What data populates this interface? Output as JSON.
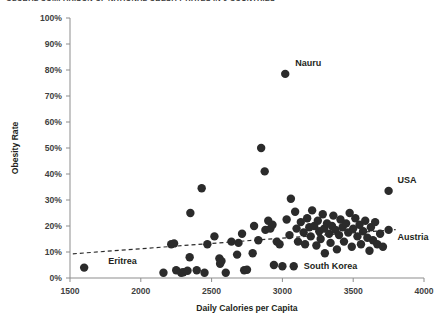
{
  "chart_title": "GLOBAL COMPARISON OF NATIONAL OBESITY RATES IN 9 COUNTRIES",
  "axis": {
    "x_title": "Daily Calories per Capita",
    "y_title": "Obesity Rate",
    "x_ticks": [
      "1500",
      "2000",
      "2500",
      "3000",
      "3500",
      "4000"
    ],
    "y_ticks": [
      "100%",
      "90%",
      "80%",
      "70%",
      "60%",
      "50%",
      "40%",
      "30%",
      "20%",
      "10%",
      "0%"
    ]
  },
  "annotations": [
    {
      "name": "Nauru",
      "x": 3020,
      "y": 78.5,
      "dx": 10,
      "dy": -8
    },
    {
      "name": "USA",
      "x": 3750,
      "y": 33.5,
      "dx": 9,
      "dy": -8
    },
    {
      "name": "Austria",
      "x": 3750,
      "y": 18.5,
      "dx": 9,
      "dy": 10
    },
    {
      "name": "Eritrea",
      "x": 1600,
      "y": 4.0,
      "dx": 24,
      "dy": -4
    },
    {
      "name": "South Korea",
      "x": 3080,
      "y": 4.5,
      "dx": 10,
      "dy": 3
    }
  ],
  "chart_data": {
    "type": "scatter",
    "title": "GLOBAL COMPARISON OF NATIONAL OBESITY RATES IN 9 COUNTRIES",
    "xlabel": "Daily Calories per Capita",
    "ylabel": "Obesity Rate",
    "xlim": [
      1500,
      4000
    ],
    "ylim": [
      0,
      100
    ],
    "xticks": [
      1500,
      2000,
      2500,
      3000,
      3500,
      4000
    ],
    "yticks": [
      0,
      10,
      20,
      30,
      40,
      50,
      60,
      70,
      80,
      90,
      100
    ],
    "grid": false,
    "legend": "none",
    "marker_color": "#2b2b2b",
    "trendline": {
      "style": "dashed",
      "color": "#2b2b2b",
      "x_start": 1520,
      "y_start": 9.3,
      "x_end": 3800,
      "y_end": 18.6
    },
    "points": [
      {
        "x": 1600,
        "y": 4.0,
        "label": "Eritrea"
      },
      {
        "x": 2160,
        "y": 2.0,
        "label": ""
      },
      {
        "x": 2215,
        "y": 13.0,
        "label": ""
      },
      {
        "x": 2235,
        "y": 13.3,
        "label": ""
      },
      {
        "x": 2250,
        "y": 3.0,
        "label": ""
      },
      {
        "x": 2285,
        "y": 2.0,
        "label": ""
      },
      {
        "x": 2300,
        "y": 2.2,
        "label": ""
      },
      {
        "x": 2330,
        "y": 2.8,
        "label": ""
      },
      {
        "x": 2345,
        "y": 8.0,
        "label": ""
      },
      {
        "x": 2350,
        "y": 25.0,
        "label": ""
      },
      {
        "x": 2395,
        "y": 3.0,
        "label": ""
      },
      {
        "x": 2430,
        "y": 34.5,
        "label": ""
      },
      {
        "x": 2450,
        "y": 2.0,
        "label": ""
      },
      {
        "x": 2470,
        "y": 13.0,
        "label": ""
      },
      {
        "x": 2520,
        "y": 16.0,
        "label": ""
      },
      {
        "x": 2555,
        "y": 7.5,
        "label": ""
      },
      {
        "x": 2560,
        "y": 5.5,
        "label": ""
      },
      {
        "x": 2570,
        "y": 6.5,
        "label": ""
      },
      {
        "x": 2600,
        "y": 2.0,
        "label": ""
      },
      {
        "x": 2640,
        "y": 14.0,
        "label": ""
      },
      {
        "x": 2680,
        "y": 9.0,
        "label": ""
      },
      {
        "x": 2690,
        "y": 13.5,
        "label": ""
      },
      {
        "x": 2715,
        "y": 17.0,
        "label": ""
      },
      {
        "x": 2730,
        "y": 3.0,
        "label": ""
      },
      {
        "x": 2750,
        "y": 3.2,
        "label": ""
      },
      {
        "x": 2790,
        "y": 9.5,
        "label": ""
      },
      {
        "x": 2800,
        "y": 20.0,
        "label": ""
      },
      {
        "x": 2830,
        "y": 14.5,
        "label": ""
      },
      {
        "x": 2850,
        "y": 50.0,
        "label": ""
      },
      {
        "x": 2875,
        "y": 41.0,
        "label": ""
      },
      {
        "x": 2880,
        "y": 18.5,
        "label": ""
      },
      {
        "x": 2900,
        "y": 22.0,
        "label": ""
      },
      {
        "x": 2915,
        "y": 19.0,
        "label": ""
      },
      {
        "x": 2930,
        "y": 20.5,
        "label": ""
      },
      {
        "x": 2940,
        "y": 5.0,
        "label": ""
      },
      {
        "x": 2960,
        "y": 14.0,
        "label": ""
      },
      {
        "x": 2980,
        "y": 13.0,
        "label": ""
      },
      {
        "x": 3000,
        "y": 4.5,
        "label": ""
      },
      {
        "x": 3020,
        "y": 78.5,
        "label": "Nauru"
      },
      {
        "x": 3030,
        "y": 22.5,
        "label": ""
      },
      {
        "x": 3050,
        "y": 16.5,
        "label": ""
      },
      {
        "x": 3060,
        "y": 30.5,
        "label": ""
      },
      {
        "x": 3080,
        "y": 4.5,
        "label": "South Korea"
      },
      {
        "x": 3090,
        "y": 25.5,
        "label": ""
      },
      {
        "x": 3100,
        "y": 19.0,
        "label": ""
      },
      {
        "x": 3110,
        "y": 14.0,
        "label": ""
      },
      {
        "x": 3130,
        "y": 21.5,
        "label": ""
      },
      {
        "x": 3150,
        "y": 17.5,
        "label": ""
      },
      {
        "x": 3160,
        "y": 13.0,
        "label": ""
      },
      {
        "x": 3175,
        "y": 23.0,
        "label": ""
      },
      {
        "x": 3190,
        "y": 19.5,
        "label": ""
      },
      {
        "x": 3200,
        "y": 16.0,
        "label": ""
      },
      {
        "x": 3210,
        "y": 26.0,
        "label": ""
      },
      {
        "x": 3225,
        "y": 20.0,
        "label": ""
      },
      {
        "x": 3240,
        "y": 12.5,
        "label": ""
      },
      {
        "x": 3250,
        "y": 22.0,
        "label": ""
      },
      {
        "x": 3260,
        "y": 18.0,
        "label": ""
      },
      {
        "x": 3270,
        "y": 15.0,
        "label": ""
      },
      {
        "x": 3285,
        "y": 24.5,
        "label": ""
      },
      {
        "x": 3295,
        "y": 19.0,
        "label": ""
      },
      {
        "x": 3300,
        "y": 9.5,
        "label": ""
      },
      {
        "x": 3315,
        "y": 21.0,
        "label": ""
      },
      {
        "x": 3330,
        "y": 17.0,
        "label": ""
      },
      {
        "x": 3340,
        "y": 13.5,
        "label": ""
      },
      {
        "x": 3350,
        "y": 20.0,
        "label": ""
      },
      {
        "x": 3360,
        "y": 24.0,
        "label": ""
      },
      {
        "x": 3375,
        "y": 18.5,
        "label": ""
      },
      {
        "x": 3385,
        "y": 11.0,
        "label": ""
      },
      {
        "x": 3400,
        "y": 16.5,
        "label": ""
      },
      {
        "x": 3410,
        "y": 22.5,
        "label": ""
      },
      {
        "x": 3425,
        "y": 19.5,
        "label": ""
      },
      {
        "x": 3435,
        "y": 14.0,
        "label": ""
      },
      {
        "x": 3450,
        "y": 21.0,
        "label": ""
      },
      {
        "x": 3465,
        "y": 17.5,
        "label": ""
      },
      {
        "x": 3475,
        "y": 25.0,
        "label": ""
      },
      {
        "x": 3490,
        "y": 12.0,
        "label": ""
      },
      {
        "x": 3500,
        "y": 19.0,
        "label": ""
      },
      {
        "x": 3515,
        "y": 23.0,
        "label": ""
      },
      {
        "x": 3530,
        "y": 16.0,
        "label": ""
      },
      {
        "x": 3545,
        "y": 20.5,
        "label": ""
      },
      {
        "x": 3555,
        "y": 13.0,
        "label": ""
      },
      {
        "x": 3570,
        "y": 18.0,
        "label": ""
      },
      {
        "x": 3585,
        "y": 22.0,
        "label": ""
      },
      {
        "x": 3600,
        "y": 15.5,
        "label": ""
      },
      {
        "x": 3615,
        "y": 10.5,
        "label": ""
      },
      {
        "x": 3625,
        "y": 19.5,
        "label": ""
      },
      {
        "x": 3640,
        "y": 14.5,
        "label": ""
      },
      {
        "x": 3655,
        "y": 21.5,
        "label": ""
      },
      {
        "x": 3670,
        "y": 13.0,
        "label": ""
      },
      {
        "x": 3690,
        "y": 17.0,
        "label": ""
      },
      {
        "x": 3710,
        "y": 12.0,
        "label": ""
      },
      {
        "x": 3750,
        "y": 33.5,
        "label": "USA"
      },
      {
        "x": 3750,
        "y": 18.5,
        "label": "Austria"
      }
    ]
  }
}
